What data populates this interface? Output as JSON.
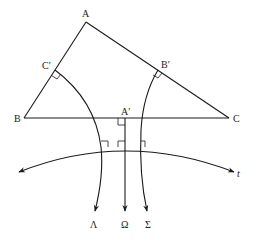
{
  "diagram": {
    "type": "hyperbolic geometry figure",
    "vertices": {
      "A": "A",
      "B": "B",
      "C": "C"
    },
    "midpoints": {
      "a_prime": "A′",
      "b_prime": "B′",
      "c_prime": "C′"
    },
    "curves": {
      "lambda": "Λ",
      "omega": "Ω",
      "sigma": "Σ",
      "t": "t"
    },
    "right_angle_marks": [
      "C′ on AB",
      "B′ on AC",
      "A′ on BC",
      "Λ meets t",
      "Ω meets t",
      "Σ meets t"
    ],
    "stroke_color": "#1a1a1a",
    "background_color": "#ffffff"
  }
}
